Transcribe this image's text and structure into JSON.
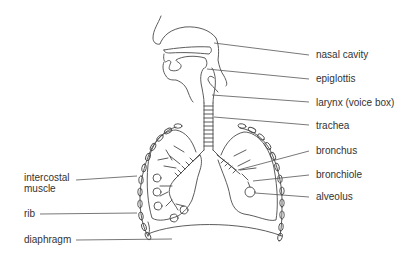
{
  "diagram": {
    "labels_right": [
      {
        "id": "nasal-cavity",
        "text": "nasal cavity"
      },
      {
        "id": "epiglottis",
        "text": "epiglottis"
      },
      {
        "id": "larynx",
        "text": "larynx (voice box)"
      },
      {
        "id": "trachea",
        "text": "trachea"
      },
      {
        "id": "bronchus",
        "text": "bronchus"
      },
      {
        "id": "bronchiole",
        "text": "bronchiole"
      },
      {
        "id": "alveolus",
        "text": "alveolus"
      }
    ],
    "labels_left": [
      {
        "id": "intercostal-muscle",
        "line1": "intercostal",
        "line2": "muscle"
      },
      {
        "id": "rib",
        "text": "rib"
      },
      {
        "id": "diaphragm",
        "text": "diaphragm"
      }
    ],
    "colors": {
      "line": "#4a4a4a",
      "text": "#333333",
      "background": "#ffffff"
    }
  }
}
